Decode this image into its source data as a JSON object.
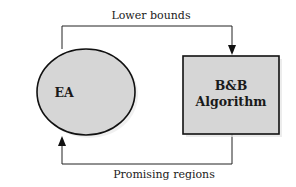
{
  "diagram": {
    "nodes": [
      {
        "id": "ea",
        "label": "EA",
        "shape": "ellipse",
        "fill": "#d6d6d6",
        "stroke": "#111111"
      },
      {
        "id": "bb",
        "label_lines": [
          "B&B",
          "Algorithm"
        ],
        "shape": "rectangle",
        "fill": "#d6d6d6",
        "stroke": "#111111"
      }
    ],
    "edges": [
      {
        "from": "ea",
        "to": "bb",
        "label": "Lower bounds"
      },
      {
        "from": "bb",
        "to": "ea",
        "label": "Promising regions"
      }
    ]
  }
}
